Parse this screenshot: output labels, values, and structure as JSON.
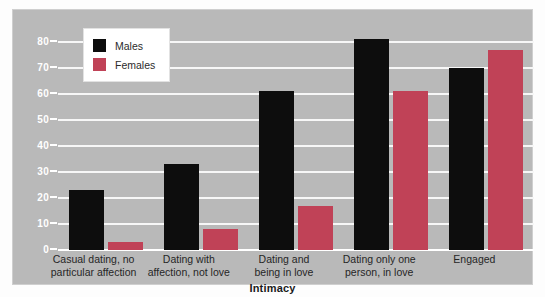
{
  "chart_data": {
    "type": "bar",
    "title": "",
    "xlabel": "Intimacy",
    "ylabel": "",
    "ylim": [
      0,
      80
    ],
    "yticks": [
      0,
      10,
      20,
      30,
      40,
      50,
      60,
      70,
      80
    ],
    "grid": true,
    "legend_position": "top-left",
    "categories": [
      "Casual dating, no\nparticular affection",
      "Dating with\naffection, not love",
      "Dating and\nbeing in love",
      "Dating only one\nperson, in love",
      "Engaged"
    ],
    "series": [
      {
        "name": "Males",
        "color": "#0d0d0d",
        "values": [
          23,
          33,
          61,
          81,
          70
        ]
      },
      {
        "name": "Females",
        "color": "#c04257",
        "values": [
          3,
          8,
          17,
          61,
          77
        ]
      }
    ]
  },
  "legend": {
    "items": [
      {
        "label": "Males",
        "color": "#0d0d0d"
      },
      {
        "label": "Females",
        "color": "#c04257"
      }
    ]
  },
  "axis": {
    "x_title": "Intimacy"
  },
  "colors": {
    "panel_background": "#b9b9b9",
    "gridline": "#f7f7f7",
    "baseline": "#ffffff",
    "tick_text": "#ffffff",
    "label_text": "#262626",
    "males": "#0d0d0d",
    "females": "#c04257"
  }
}
